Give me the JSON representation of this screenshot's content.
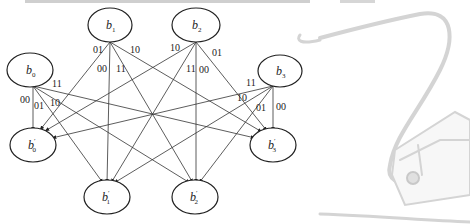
{
  "diagram": {
    "type": "bipartite-state-transition",
    "colors": {
      "stroke": "#222222",
      "background": "#ffffff",
      "decoration": "#d9d9d9"
    },
    "source_nodes": [
      {
        "id": "b0",
        "base": "b",
        "sub": "0",
        "cx": 30,
        "cy": 70
      },
      {
        "id": "b1",
        "base": "b",
        "sub": "1",
        "cx": 110,
        "cy": 25
      },
      {
        "id": "b2",
        "base": "b",
        "sub": "2",
        "cx": 196,
        "cy": 25
      },
      {
        "id": "b3",
        "base": "b",
        "sub": "3",
        "cx": 280,
        "cy": 71
      }
    ],
    "target_nodes": [
      {
        "id": "b0p",
        "base": "b",
        "sub": "0",
        "prime": "′",
        "cx": 33,
        "cy": 145
      },
      {
        "id": "b1p",
        "base": "b",
        "sub": "1",
        "prime": "′",
        "cx": 107,
        "cy": 197
      },
      {
        "id": "b2p",
        "base": "b",
        "sub": "2",
        "prime": "′",
        "cx": 195,
        "cy": 197
      },
      {
        "id": "b3p",
        "base": "b",
        "sub": "3",
        "prime": "′",
        "cx": 273,
        "cy": 145
      }
    ],
    "edge_labels": [
      {
        "from": "b0",
        "text": "00",
        "x": 20,
        "y": 103
      },
      {
        "from": "b0",
        "text": "01",
        "x": 34,
        "y": 109
      },
      {
        "from": "b0",
        "text": "10",
        "x": 50,
        "y": 106
      },
      {
        "from": "b0",
        "text": "11",
        "x": 52,
        "y": 87
      },
      {
        "from": "b1",
        "text": "01",
        "x": 93,
        "y": 53
      },
      {
        "from": "b1",
        "text": "00",
        "x": 98,
        "y": 72
      },
      {
        "from": "b1",
        "text": "11",
        "x": 116,
        "y": 72
      },
      {
        "from": "b1",
        "text": "10",
        "x": 130,
        "y": 53
      },
      {
        "from": "b2",
        "text": "10",
        "x": 170,
        "y": 51
      },
      {
        "from": "b2",
        "text": "11",
        "x": 186,
        "y": 72
      },
      {
        "from": "b2",
        "text": "00",
        "x": 199,
        "y": 73
      },
      {
        "from": "b2",
        "text": "01",
        "x": 212,
        "y": 56
      },
      {
        "from": "b3",
        "text": "11",
        "x": 246,
        "y": 86
      },
      {
        "from": "b3",
        "text": "10",
        "x": 237,
        "y": 101
      },
      {
        "from": "b3",
        "text": "01",
        "x": 256,
        "y": 111
      },
      {
        "from": "b3",
        "text": "00",
        "x": 276,
        "y": 110
      }
    ]
  }
}
